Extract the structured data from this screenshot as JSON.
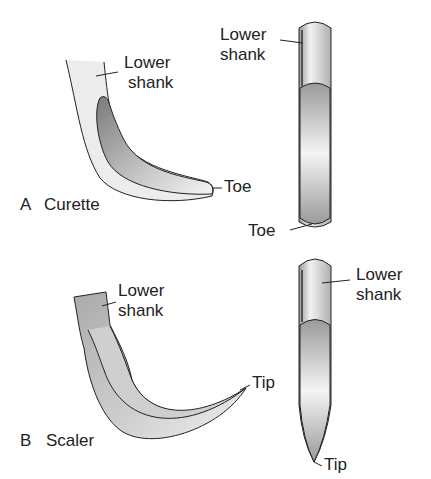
{
  "panel_a": {
    "letter": "A",
    "title": "Curette",
    "side_view": {
      "lower_shank_label_1": "Lower",
      "lower_shank_label_2": "shank",
      "toe_label": "Toe"
    },
    "face_view": {
      "lower_shank_label_1": "Lower",
      "lower_shank_label_2": "shank",
      "toe_label": "Toe"
    }
  },
  "panel_b": {
    "letter": "B",
    "title": "Scaler",
    "side_view": {
      "lower_shank_label_1": "Lower",
      "lower_shank_label_2": "shank",
      "tip_label": "Tip"
    },
    "face_view": {
      "lower_shank_label_1": "Lower",
      "lower_shank_label_2": "shank",
      "tip_label": "Tip"
    }
  },
  "colors": {
    "stroke": "#222222",
    "dark_fill": "#8a8a8a",
    "light_fill": "#e6e6e6"
  }
}
